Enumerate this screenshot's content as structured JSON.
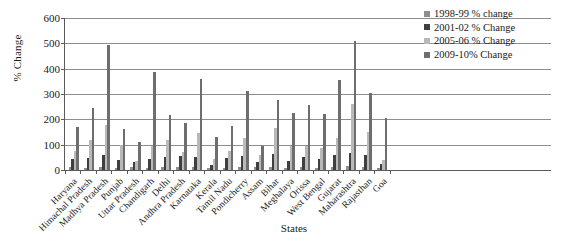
{
  "chart_data": {
    "type": "bar",
    "title": "",
    "xlabel": "States",
    "ylabel": "% Change",
    "ylim": [
      0,
      600
    ],
    "yticks": [
      0,
      100,
      200,
      300,
      400,
      500,
      600
    ],
    "grid": true,
    "legend_position": "top-right",
    "categories": [
      "Haryana",
      "Himachal Pradesh",
      "Madhya Pradesh",
      "Punjab",
      "Uttar Pradesh",
      "Chandigarh",
      "Delhi",
      "Andhra Pradesh",
      "Karnataka",
      "Kerala",
      "Tamil Nadu",
      "Pondicherry",
      "Assam",
      "Bihar",
      "Meghalaya",
      "Orissa",
      "West Bengal",
      "Gujarat",
      "Maharashtra",
      "Rajasthan",
      "Goa"
    ],
    "series": [
      {
        "name": "1998-99 % change",
        "color": "#8e8e8e",
        "values": [
          10,
          8,
          12,
          6,
          10,
          8,
          12,
          10,
          12,
          6,
          8,
          10,
          12,
          10,
          8,
          10,
          8,
          12,
          14,
          12,
          8
        ]
      },
      {
        "name": "2001-02 % Change",
        "color": "#3f3f3f",
        "values": [
          45,
          48,
          60,
          40,
          30,
          45,
          50,
          55,
          50,
          20,
          48,
          55,
          30,
          62,
          35,
          50,
          45,
          60,
          68,
          60,
          25
        ]
      },
      {
        "name": "2005-06 % Change",
        "color": "#b9b9b9",
        "values": [
          75,
          120,
          178,
          100,
          35,
          95,
          118,
          70,
          148,
          45,
          75,
          128,
          60,
          165,
          95,
          95,
          85,
          128,
          260,
          150,
          40
        ]
      },
      {
        "name": "2009-10% Change",
        "color": "#6e6e6e",
        "values": [
          168,
          245,
          495,
          160,
          110,
          385,
          218,
          185,
          360,
          130,
          175,
          312,
          95,
          275,
          225,
          255,
          220,
          355,
          510,
          305,
          205
        ]
      }
    ]
  },
  "axis": {
    "y_title": "% Change",
    "x_title": "States"
  }
}
